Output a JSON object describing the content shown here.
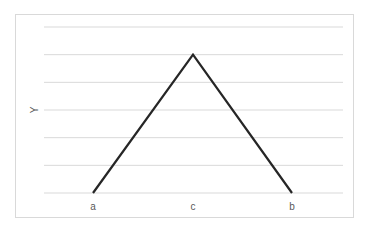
{
  "chart_data": {
    "type": "line",
    "title": "",
    "xlabel": "",
    "ylabel": "Y",
    "categories": [
      "a",
      "c",
      "b"
    ],
    "series": [
      {
        "name": "Y",
        "values": [
          0,
          5,
          0
        ],
        "color": "#262626"
      }
    ],
    "ylim": [
      0,
      6
    ],
    "grid": {
      "horizontal": true,
      "vertical": false,
      "lines": 7,
      "color": "#d9d9d9"
    },
    "legend": "none",
    "y_tick_labels_visible": false
  },
  "axis": {
    "y_title": "Y",
    "x_labels": [
      "a",
      "c",
      "b"
    ]
  }
}
